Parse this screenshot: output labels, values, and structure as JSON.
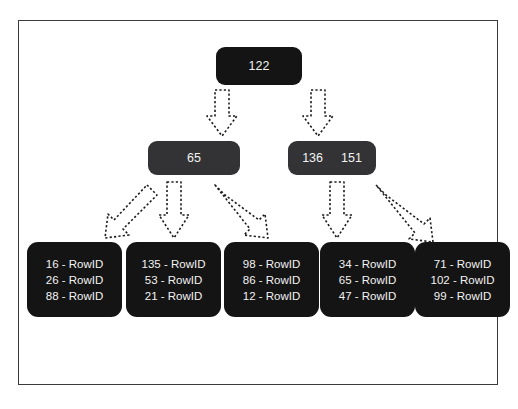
{
  "diagram": {
    "type": "b-tree-index",
    "title": "",
    "frame_color": "#3a3a3c",
    "background": "#ffffff",
    "colors": {
      "root_node": "#141414",
      "internal_node": "#333335",
      "leaf_node": "#141414",
      "node_text": "#f2f2f2",
      "arrow_fill": "#ffffff",
      "arrow_stroke": "#1c1c1c"
    },
    "root": {
      "keys": [
        "122"
      ],
      "label": "122"
    },
    "internal_nodes": [
      {
        "keys": [
          "65"
        ],
        "label": "65"
      },
      {
        "keys": [
          "136",
          "151"
        ],
        "label": "136 151"
      }
    ],
    "leaf_nodes": [
      {
        "entries": [
          "16 - RowID",
          "26 - RowID",
          "88 - RowID"
        ]
      },
      {
        "entries": [
          "135 - RowID",
          "53 - RowID",
          "21 - RowID"
        ]
      },
      {
        "entries": [
          "98 - RowID",
          "86 - RowID",
          "12 - RowID"
        ]
      },
      {
        "entries": [
          "34 - RowID",
          "65 - RowID",
          "47 - RowID"
        ]
      },
      {
        "entries": [
          "71 - RowID",
          "102 - RowID",
          "99 - RowID"
        ]
      }
    ],
    "arrows": [
      {
        "from": "root",
        "to": "internal-left",
        "style": "dashed-block-arrow",
        "direction": "down"
      },
      {
        "from": "root",
        "to": "internal-right",
        "style": "dashed-block-arrow",
        "direction": "down"
      },
      {
        "from": "internal-left",
        "to": "leaf-0",
        "style": "dashed-block-arrow",
        "direction": "down-left"
      },
      {
        "from": "internal-left",
        "to": "leaf-1",
        "style": "dashed-block-arrow",
        "direction": "down"
      },
      {
        "from": "internal-left",
        "to": "leaf-2",
        "style": "dashed-block-arrow",
        "direction": "down-right"
      },
      {
        "from": "internal-right",
        "to": "leaf-3",
        "style": "dashed-block-arrow",
        "direction": "down"
      },
      {
        "from": "internal-right",
        "to": "leaf-4",
        "style": "dashed-block-arrow",
        "direction": "down-right"
      }
    ]
  }
}
